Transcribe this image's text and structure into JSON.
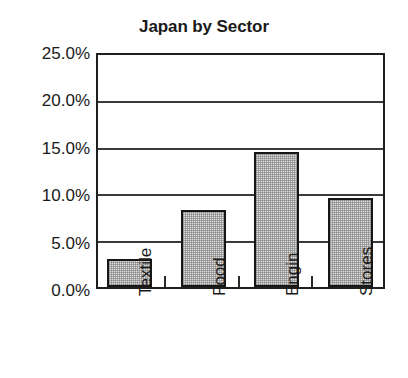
{
  "chart_data": {
    "type": "bar",
    "title": "Japan by Sector",
    "xlabel": "",
    "ylabel": "",
    "categories": [
      "Textile",
      "Food",
      "Engin",
      "Stores"
    ],
    "values": [
      3.0,
      8.3,
      14.6,
      9.6
    ],
    "value_suffix": "%",
    "ylim": [
      0.0,
      25.0
    ],
    "ytick_values": [
      25.0,
      20.0,
      15.0,
      10.0,
      5.0,
      0.0
    ],
    "ytick_labels": [
      "25.0%",
      "20.0%",
      "15.0%",
      "10.0%",
      "5.0%",
      "0.0%"
    ],
    "grid": true,
    "grid_axis": "y",
    "legend": false,
    "legend_position": "none",
    "bar_fill_color": "#dedede",
    "bar_edge_color": "#161616",
    "axis_color": "#1f1f1f",
    "text_color": "#1a1a1a",
    "background_color": "#ffffff",
    "label_rotation": -90
  }
}
